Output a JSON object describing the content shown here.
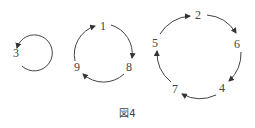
{
  "diagram": {
    "caption": "図4",
    "cycles": [
      {
        "id": "cycle-a",
        "labels": [
          "3"
        ]
      },
      {
        "id": "cycle-b",
        "labels": [
          "1",
          "8",
          "9"
        ]
      },
      {
        "id": "cycle-c",
        "labels": [
          "2",
          "6",
          "4",
          "7",
          "5"
        ]
      }
    ],
    "labels": {
      "n1": "1",
      "n2": "2",
      "n3": "3",
      "n4": "4",
      "n5": "5",
      "n6": "6",
      "n7": "7",
      "n8": "8",
      "n9": "9"
    },
    "colors": {
      "stroke": "#444444",
      "background": "#ffffff"
    }
  }
}
